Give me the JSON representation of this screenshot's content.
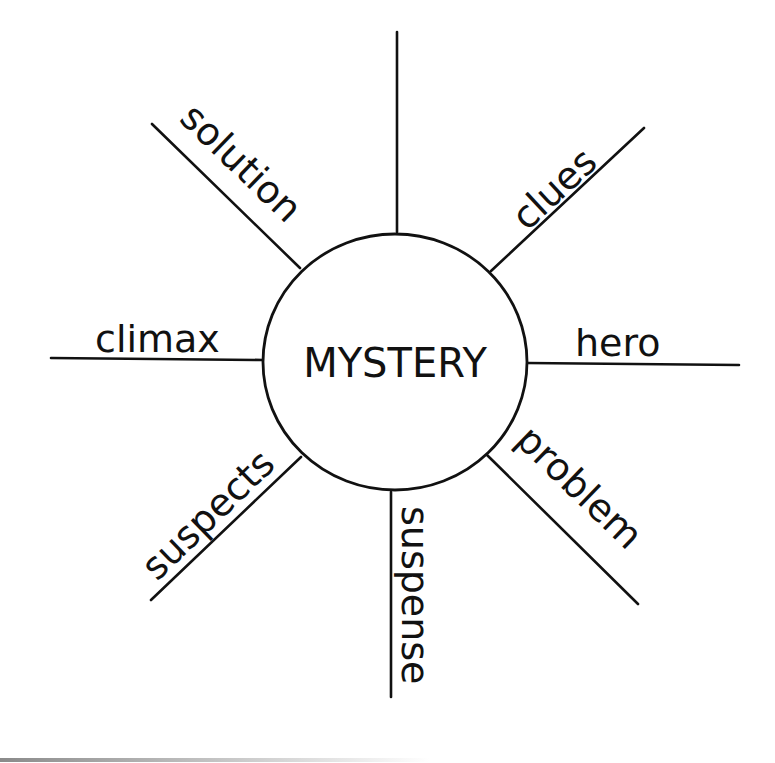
{
  "diagram": {
    "type": "spider-map",
    "center": {
      "label": "MYSTERY"
    },
    "spokes": [
      {
        "id": "top",
        "label": ""
      },
      {
        "id": "clues",
        "label": "clues"
      },
      {
        "id": "hero",
        "label": "hero"
      },
      {
        "id": "problem",
        "label": "problem"
      },
      {
        "id": "suspense",
        "label": "suspense"
      },
      {
        "id": "suspects",
        "label": "suspects"
      },
      {
        "id": "climax",
        "label": "climax"
      },
      {
        "id": "solution",
        "label": "solution"
      }
    ]
  },
  "colors": {
    "ink": "#111111",
    "background": "#ffffff"
  }
}
